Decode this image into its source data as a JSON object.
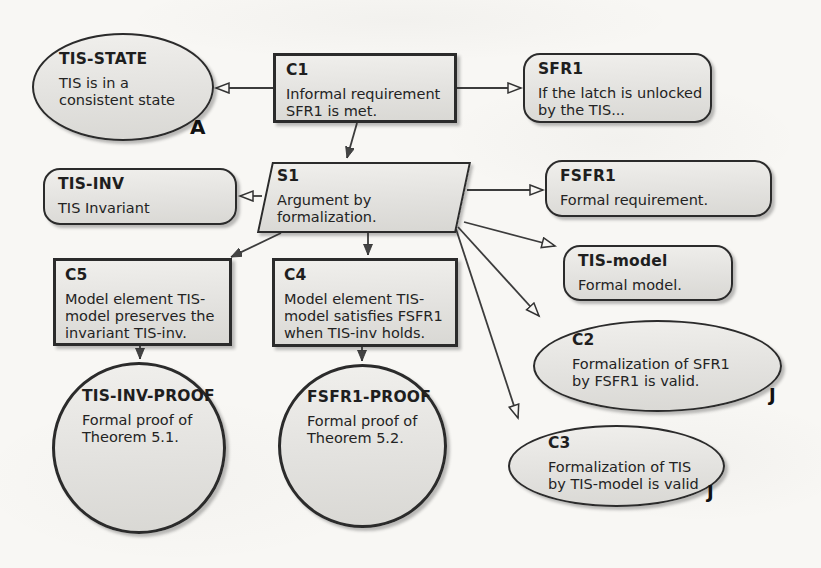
{
  "figure_type": "GSN argument diagram (scanned paper figure)",
  "colors": {
    "background": "#f8f7f4",
    "node_fill_top": "#f0efec",
    "node_fill_bottom": "#d9d8d4",
    "node_border": "#2b2b2b",
    "text": "#1e1e1e",
    "arrow": "#3c3c3c"
  },
  "nodes": {
    "tis_state": {
      "id": "TIS-STATE",
      "body": "TIS is in a\nconsistent state",
      "annotation": "A",
      "shape": "ellipse (assumption)"
    },
    "c1": {
      "id": "C1",
      "body": "Informal requirement\nSFR1 is met.",
      "shape": "rectangle (goal)"
    },
    "sfr1": {
      "id": "SFR1",
      "body": "If the latch is unlocked\nby the TIS...",
      "shape": "rounded rectangle (context)"
    },
    "tis_inv": {
      "id": "TIS-INV",
      "body": "TIS Invariant",
      "shape": "rounded rectangle (context)"
    },
    "s1": {
      "id": "S1",
      "body": "Argument by\nformalization.",
      "shape": "parallelogram (strategy)"
    },
    "fsfr1": {
      "id": "FSFR1",
      "body": "Formal requirement.",
      "shape": "rounded rectangle (context)"
    },
    "c5": {
      "id": "C5",
      "body": "Model element TIS-\nmodel preserves the\ninvariant TIS-inv.",
      "shape": "rectangle (goal)"
    },
    "c4": {
      "id": "C4",
      "body": "Model element TIS-\nmodel satisfies FSFR1\nwhen TIS-inv holds.",
      "shape": "rectangle (goal)"
    },
    "tis_model": {
      "id": "TIS-model",
      "body": "Formal model.",
      "shape": "rounded rectangle (context)"
    },
    "c2": {
      "id": "C2",
      "body": "Formalization of SFR1\nby FSFR1 is valid.",
      "annotation": "J",
      "shape": "ellipse (justification)"
    },
    "c3": {
      "id": "C3",
      "body": "Formalization of TIS\nby TIS-model is valid",
      "annotation": "J",
      "shape": "ellipse (justification)"
    },
    "tis_inv_proof": {
      "id": "TIS-INV-PROOF",
      "body": "Formal proof of\nTheorem 5.1.",
      "shape": "circle (solution)"
    },
    "fsfr1_proof": {
      "id": "FSFR1-PROOF",
      "body": "Formal proof of\nTheorem 5.2.",
      "shape": "circle (solution)"
    }
  },
  "edges": [
    {
      "from": "C1",
      "to": "TIS-STATE",
      "arrowhead": "hollow"
    },
    {
      "from": "C1",
      "to": "SFR1",
      "arrowhead": "hollow"
    },
    {
      "from": "C1",
      "to": "S1",
      "arrowhead": "solid"
    },
    {
      "from": "S1",
      "to": "TIS-INV",
      "arrowhead": "hollow"
    },
    {
      "from": "S1",
      "to": "FSFR1",
      "arrowhead": "hollow"
    },
    {
      "from": "S1",
      "to": "C5",
      "arrowhead": "solid"
    },
    {
      "from": "S1",
      "to": "C4",
      "arrowhead": "solid"
    },
    {
      "from": "S1",
      "to": "TIS-model",
      "arrowhead": "hollow"
    },
    {
      "from": "S1",
      "to": "C2",
      "arrowhead": "hollow"
    },
    {
      "from": "S1",
      "to": "C3",
      "arrowhead": "hollow"
    },
    {
      "from": "C5",
      "to": "TIS-INV-PROOF",
      "arrowhead": "solid"
    },
    {
      "from": "C4",
      "to": "FSFR1-PROOF",
      "arrowhead": "solid"
    }
  ]
}
